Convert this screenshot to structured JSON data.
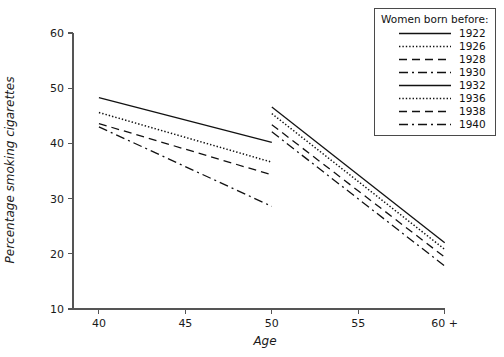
{
  "chart_data": {
    "type": "line",
    "title": "",
    "xlabel": "Age",
    "ylabel": "Percentage smoking cigarettes",
    "xlim": [
      38.5,
      61.0
    ],
    "ylim": [
      10,
      62
    ],
    "grid": false,
    "legend_position": "top-right",
    "legend_title": "Women born before:",
    "x_ticks": [
      {
        "value": 40,
        "label": "40"
      },
      {
        "value": 45,
        "label": "45"
      },
      {
        "value": 50,
        "label": "50"
      },
      {
        "value": 55,
        "label": "55"
      },
      {
        "value": 60,
        "label": "60 +"
      }
    ],
    "y_ticks": [
      {
        "value": 10,
        "label": "10"
      },
      {
        "value": 20,
        "label": "20"
      },
      {
        "value": 30,
        "label": "30"
      },
      {
        "value": 40,
        "label": "40"
      },
      {
        "value": 50,
        "label": "50"
      },
      {
        "value": 60,
        "label": "60"
      }
    ],
    "series": [
      {
        "name": "1922",
        "style": "solid",
        "x": [
          40,
          50
        ],
        "values": [
          48.3,
          40.2
        ]
      },
      {
        "name": "1926",
        "style": "dotted",
        "x": [
          40,
          50
        ],
        "values": [
          45.6,
          36.6
        ]
      },
      {
        "name": "1928",
        "style": "dashed",
        "x": [
          40,
          50
        ],
        "values": [
          43.6,
          34.3
        ]
      },
      {
        "name": "1930",
        "style": "dashdot",
        "x": [
          40,
          50
        ],
        "values": [
          43.0,
          28.6
        ]
      },
      {
        "name": "1932",
        "style": "solid",
        "x": [
          50,
          60
        ],
        "values": [
          46.6,
          22.0
        ]
      },
      {
        "name": "1936",
        "style": "dotted",
        "x": [
          50,
          60
        ],
        "values": [
          45.4,
          20.8
        ]
      },
      {
        "name": "1938",
        "style": "dashed",
        "x": [
          50,
          60
        ],
        "values": [
          43.4,
          19.4
        ]
      },
      {
        "name": "1940",
        "style": "dashdot",
        "x": [
          50,
          60
        ],
        "values": [
          42.1,
          17.8
        ]
      }
    ]
  },
  "legend": {
    "title": "Women born before:",
    "entries": [
      {
        "label": "1922",
        "style": "solid"
      },
      {
        "label": "1926",
        "style": "dotted"
      },
      {
        "label": "1928",
        "style": "dashed"
      },
      {
        "label": "1930",
        "style": "dashdot"
      },
      {
        "label": "1932",
        "style": "solid"
      },
      {
        "label": "1936",
        "style": "dotted"
      },
      {
        "label": "1938",
        "style": "dashed"
      },
      {
        "label": "1940",
        "style": "dashdot"
      }
    ]
  },
  "colors": {
    "line": "#111111",
    "axis": "#555555",
    "text": "#1a1a1a",
    "legend_border": "#4a4a4a",
    "background": "#ffffff"
  }
}
